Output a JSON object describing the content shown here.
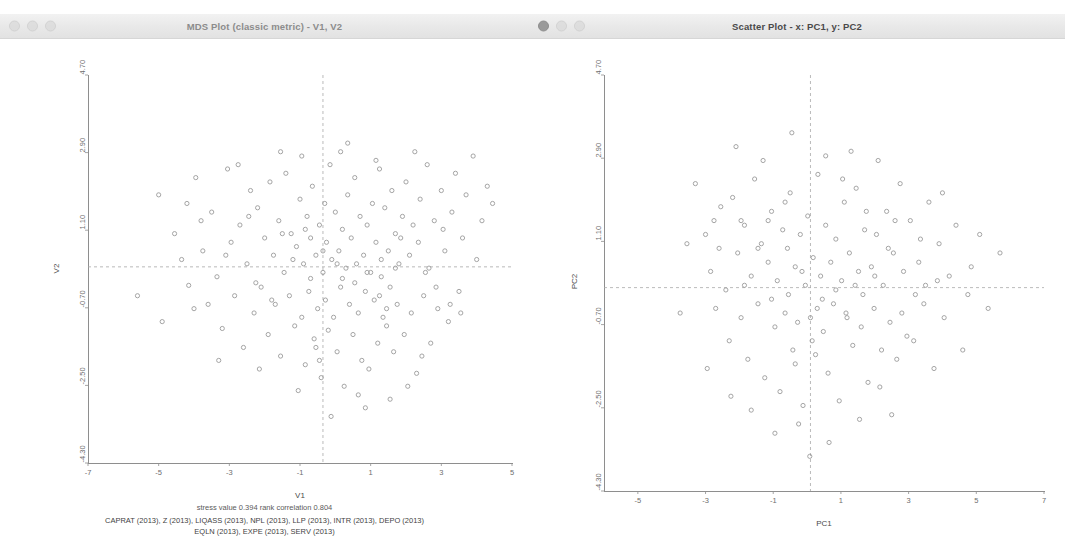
{
  "windows": {
    "mds": {
      "title": "MDS Plot (classic metric) - V1, V2",
      "traffic_lights": [
        "close",
        "minimize",
        "zoom"
      ],
      "axis": {
        "xlabel": "V1",
        "ylabel": "V2",
        "xticks": [
          "-7",
          "-5",
          "-3",
          "-1",
          "1",
          "3",
          "5"
        ],
        "yticks": [
          "4.70",
          "2.90",
          "1.10",
          "-0.70",
          "-2.50",
          "-4.30"
        ],
        "xlim": [
          -7,
          5
        ],
        "ylim": [
          -4.3,
          4.7
        ]
      },
      "stress_line": "stress value  0.394   rank correlation  0.804",
      "variables_line1": "CAPRAT (2013), Z (2013), LIQASS (2013), NPL (2013), LLP (2013), INTR (2013), DEPO (2013)",
      "variables_line2": "EQLN (2013), EXPE (2013), SERV (2013)"
    },
    "scatter": {
      "title": "Scatter Plot - x: PC1, y: PC2",
      "traffic_lights": [
        "close",
        "minimize",
        "zoom"
      ],
      "axis": {
        "xlabel": "PC1",
        "ylabel": "PC2",
        "xticks": [
          "-5",
          "-3",
          "-1",
          "1",
          "3",
          "5",
          "7"
        ],
        "yticks": [
          "4.70",
          "2.90",
          "1.10",
          "-0.70",
          "-2.50",
          "-4.30"
        ],
        "xlim": [
          -6,
          7
        ],
        "ylim": [
          -4.3,
          4.7
        ]
      }
    }
  },
  "style": {
    "point_color": "#9b9b9b",
    "reference_line_color": "#a8a8a8",
    "axis_color": "#8e8e8e"
  },
  "chart_data": [
    {
      "id": "mds",
      "type": "scatter",
      "title": "MDS Plot (classic metric) - V1, V2",
      "xlabel": "V1",
      "ylabel": "V2",
      "xlim": [
        -7,
        5
      ],
      "ylim": [
        -4.3,
        4.7
      ],
      "grid": false,
      "legend": "none",
      "annotations": [
        "stress value  0.394   rank correlation  0.804",
        "CAPRAT (2013), Z (2013), LIQASS (2013), NPL (2013), LLP (2013), INTR (2013), DEPO (2013)",
        "EQLN (2013), EXPE (2013), SERV (2013)"
      ],
      "reference_lines": {
        "vlines": [
          -0.35
        ],
        "hlines": [
          0.25
        ]
      },
      "marker": "open-circle",
      "points": [
        [
          -5.0,
          1.92
        ],
        [
          -4.55,
          1.02
        ],
        [
          -4.35,
          0.42
        ],
        [
          -4.15,
          -0.18
        ],
        [
          -3.95,
          2.32
        ],
        [
          -3.75,
          0.62
        ],
        [
          -3.6,
          -0.62
        ],
        [
          -3.5,
          1.52
        ],
        [
          -3.35,
          0.02
        ],
        [
          -3.2,
          -1.18
        ],
        [
          -3.05,
          2.52
        ],
        [
          -2.95,
          0.82
        ],
        [
          -2.85,
          -0.42
        ],
        [
          -2.7,
          1.22
        ],
        [
          -2.6,
          -1.62
        ],
        [
          -2.5,
          0.32
        ],
        [
          -2.4,
          2.02
        ],
        [
          -2.3,
          -0.82
        ],
        [
          -2.2,
          1.62
        ],
        [
          -2.1,
          -0.22
        ],
        [
          -2.0,
          0.92
        ],
        [
          -1.9,
          -1.32
        ],
        [
          -1.85,
          2.22
        ],
        [
          -1.75,
          0.52
        ],
        [
          -1.7,
          -0.62
        ],
        [
          -1.6,
          1.32
        ],
        [
          -1.55,
          -1.82
        ],
        [
          -1.45,
          0.12
        ],
        [
          -1.4,
          2.42
        ],
        [
          -1.3,
          -0.42
        ],
        [
          -1.25,
          1.02
        ],
        [
          -1.15,
          -1.12
        ],
        [
          -1.1,
          0.72
        ],
        [
          -1.0,
          1.82
        ],
        [
          -0.95,
          -0.92
        ],
        [
          -0.9,
          0.32
        ],
        [
          -0.85,
          -2.02
        ],
        [
          -0.8,
          1.42
        ],
        [
          -0.75,
          -0.32
        ],
        [
          -0.7,
          0.92
        ],
        [
          -0.65,
          2.12
        ],
        [
          -0.6,
          -1.42
        ],
        [
          -0.55,
          0.52
        ],
        [
          -0.5,
          -0.72
        ],
        [
          -0.45,
          1.22
        ],
        [
          -0.4,
          -2.32
        ],
        [
          -0.35,
          0.12
        ],
        [
          -0.3,
          1.72
        ],
        [
          -0.28,
          -0.52
        ],
        [
          -0.25,
          0.82
        ],
        [
          -0.2,
          -1.22
        ],
        [
          -0.15,
          2.62
        ],
        [
          -0.1,
          0.42
        ],
        [
          -0.05,
          -0.92
        ],
        [
          0.0,
          1.52
        ],
        [
          0.05,
          -1.72
        ],
        [
          0.1,
          0.62
        ],
        [
          0.15,
          -0.22
        ],
        [
          0.2,
          1.12
        ],
        [
          0.25,
          -2.52
        ],
        [
          0.3,
          0.22
        ],
        [
          0.35,
          1.92
        ],
        [
          0.4,
          -0.62
        ],
        [
          0.45,
          0.92
        ],
        [
          0.5,
          -1.32
        ],
        [
          0.55,
          2.32
        ],
        [
          0.6,
          0.32
        ],
        [
          0.65,
          -0.82
        ],
        [
          0.7,
          1.42
        ],
        [
          0.75,
          -1.92
        ],
        [
          0.8,
          0.52
        ],
        [
          0.85,
          -0.32
        ],
        [
          0.9,
          1.22
        ],
        [
          0.95,
          -2.12
        ],
        [
          1.0,
          0.12
        ],
        [
          1.05,
          1.72
        ],
        [
          1.1,
          -0.52
        ],
        [
          1.15,
          0.82
        ],
        [
          1.2,
          -1.52
        ],
        [
          1.25,
          2.52
        ],
        [
          1.3,
          0.42
        ],
        [
          1.35,
          -0.92
        ],
        [
          1.4,
          1.62
        ],
        [
          1.45,
          -1.12
        ],
        [
          1.5,
          0.62
        ],
        [
          1.55,
          -0.22
        ],
        [
          1.6,
          2.02
        ],
        [
          1.65,
          -1.72
        ],
        [
          1.7,
          1.02
        ],
        [
          1.75,
          -0.62
        ],
        [
          1.8,
          0.32
        ],
        [
          1.9,
          1.42
        ],
        [
          1.95,
          -1.32
        ],
        [
          2.0,
          2.22
        ],
        [
          2.1,
          0.52
        ],
        [
          2.15,
          -0.82
        ],
        [
          2.2,
          1.22
        ],
        [
          2.3,
          -2.22
        ],
        [
          2.35,
          0.82
        ],
        [
          2.4,
          1.82
        ],
        [
          2.5,
          -0.42
        ],
        [
          2.6,
          2.62
        ],
        [
          2.65,
          0.22
        ],
        [
          2.7,
          -1.52
        ],
        [
          2.8,
          1.32
        ],
        [
          2.9,
          -0.72
        ],
        [
          3.0,
          2.02
        ],
        [
          3.1,
          0.62
        ],
        [
          3.2,
          -1.02
        ],
        [
          3.3,
          1.52
        ],
        [
          3.4,
          2.42
        ],
        [
          3.5,
          -0.32
        ],
        [
          3.6,
          0.92
        ],
        [
          3.7,
          1.92
        ],
        [
          3.9,
          2.82
        ],
        [
          4.0,
          0.42
        ],
        [
          4.15,
          1.32
        ],
        [
          4.3,
          2.12
        ],
        [
          -5.6,
          -0.42
        ],
        [
          -4.9,
          -1.02
        ],
        [
          -4.2,
          1.72
        ],
        [
          -3.3,
          -1.92
        ],
        [
          -2.75,
          2.62
        ],
        [
          -2.15,
          -2.12
        ],
        [
          -1.5,
          1.02
        ],
        [
          -0.95,
          2.82
        ],
        [
          -0.55,
          -1.62
        ],
        [
          0.15,
          2.92
        ],
        [
          0.65,
          -2.72
        ],
        [
          1.25,
          -0.42
        ],
        [
          1.85,
          0.92
        ],
        [
          2.45,
          -1.82
        ],
        [
          3.05,
          1.12
        ],
        [
          3.55,
          -0.82
        ],
        [
          4.45,
          1.72
        ],
        [
          -0.12,
          -3.22
        ],
        [
          0.85,
          -3.02
        ],
        [
          1.55,
          -2.82
        ],
        [
          -1.05,
          -2.62
        ],
        [
          2.05,
          -2.52
        ],
        [
          0.35,
          3.12
        ],
        [
          -1.55,
          2.92
        ],
        [
          1.15,
          2.72
        ],
        [
          2.25,
          2.92
        ],
        [
          -2.45,
          1.42
        ],
        [
          -3.8,
          1.32
        ],
        [
          -0.7,
          -0.02
        ],
        [
          0.2,
          -0.02
        ],
        [
          1.3,
          0.02
        ],
        [
          -1.2,
          0.42
        ],
        [
          0.9,
          0.12
        ],
        [
          -0.35,
          0.62
        ],
        [
          0.55,
          -0.12
        ],
        [
          1.7,
          0.22
        ],
        [
          -1.8,
          -0.52
        ],
        [
          2.55,
          0.12
        ],
        [
          -2.25,
          -0.12
        ],
        [
          0.05,
          0.32
        ],
        [
          -0.85,
          1.12
        ],
        [
          1.45,
          -0.72
        ],
        [
          -0.45,
          -1.92
        ],
        [
          2.85,
          -0.22
        ],
        [
          -3.1,
          0.52
        ],
        [
          3.25,
          -0.62
        ],
        [
          -4.0,
          -0.72
        ]
      ]
    },
    {
      "id": "scatter",
      "type": "scatter",
      "title": "Scatter Plot - x: PC1, y: PC2",
      "xlabel": "PC1",
      "ylabel": "PC2",
      "xlim": [
        -6,
        7
      ],
      "ylim": [
        -4.3,
        4.7
      ],
      "grid": false,
      "legend": "none",
      "reference_lines": {
        "vlines": [
          0.1
        ],
        "hlines": [
          0.1
        ]
      },
      "marker": "open-circle",
      "points": [
        [
          -3.3,
          2.35
        ],
        [
          -3.0,
          1.25
        ],
        [
          -2.85,
          0.45
        ],
        [
          -2.7,
          -0.35
        ],
        [
          -2.55,
          1.85
        ],
        [
          -2.4,
          0.05
        ],
        [
          -2.3,
          -1.05
        ],
        [
          -2.2,
          2.05
        ],
        [
          -2.05,
          0.85
        ],
        [
          -1.95,
          -0.55
        ],
        [
          -1.85,
          1.45
        ],
        [
          -1.75,
          -1.45
        ],
        [
          -1.65,
          0.35
        ],
        [
          -1.55,
          2.45
        ],
        [
          -1.45,
          -0.25
        ],
        [
          -1.35,
          1.05
        ],
        [
          -1.25,
          -1.85
        ],
        [
          -1.15,
          0.65
        ],
        [
          -1.05,
          1.75
        ],
        [
          -0.95,
          -0.75
        ],
        [
          -0.88,
          0.25
        ],
        [
          -0.8,
          -2.15
        ],
        [
          -0.72,
          1.35
        ],
        [
          -0.65,
          -0.45
        ],
        [
          -0.58,
          0.95
        ],
        [
          -0.5,
          2.15
        ],
        [
          -0.42,
          -1.25
        ],
        [
          -0.35,
          0.55
        ],
        [
          -0.28,
          -0.65
        ],
        [
          -0.2,
          1.25
        ],
        [
          -0.12,
          -2.45
        ],
        [
          -0.05,
          0.15
        ],
        [
          0.02,
          1.65
        ],
        [
          0.1,
          -0.55
        ],
        [
          0.18,
          0.75
        ],
        [
          0.25,
          -1.35
        ],
        [
          0.32,
          2.55
        ],
        [
          0.4,
          0.35
        ],
        [
          0.48,
          -0.85
        ],
        [
          0.55,
          1.45
        ],
        [
          0.62,
          -1.75
        ],
        [
          0.7,
          0.65
        ],
        [
          0.78,
          -0.25
        ],
        [
          0.85,
          1.15
        ],
        [
          0.95,
          -2.35
        ],
        [
          1.02,
          0.25
        ],
        [
          1.1,
          1.95
        ],
        [
          1.18,
          -0.55
        ],
        [
          1.25,
          0.85
        ],
        [
          1.35,
          -1.15
        ],
        [
          1.45,
          2.25
        ],
        [
          1.52,
          0.45
        ],
        [
          1.6,
          -0.75
        ],
        [
          1.7,
          1.35
        ],
        [
          1.8,
          -1.95
        ],
        [
          1.9,
          0.55
        ],
        [
          1.98,
          -0.35
        ],
        [
          2.05,
          1.25
        ],
        [
          2.15,
          -2.05
        ],
        [
          2.25,
          0.15
        ],
        [
          2.35,
          1.75
        ],
        [
          2.45,
          -0.65
        ],
        [
          2.55,
          0.85
        ],
        [
          2.65,
          -1.45
        ],
        [
          2.75,
          2.35
        ],
        [
          2.85,
          0.45
        ],
        [
          2.95,
          -0.95
        ],
        [
          3.05,
          1.55
        ],
        [
          3.15,
          -1.05
        ],
        [
          3.3,
          0.65
        ],
        [
          3.45,
          -0.25
        ],
        [
          3.6,
          1.95
        ],
        [
          3.75,
          -1.65
        ],
        [
          3.9,
          1.05
        ],
        [
          4.05,
          -0.55
        ],
        [
          4.2,
          0.35
        ],
        [
          4.4,
          1.45
        ],
        [
          4.6,
          -1.25
        ],
        [
          4.85,
          0.55
        ],
        [
          5.1,
          1.25
        ],
        [
          5.35,
          -0.35
        ],
        [
          5.7,
          0.85
        ],
        [
          -2.1,
          3.15
        ],
        [
          -1.3,
          2.85
        ],
        [
          -0.45,
          3.45
        ],
        [
          0.55,
          2.95
        ],
        [
          1.3,
          3.05
        ],
        [
          2.1,
          2.85
        ],
        [
          -0.95,
          -3.05
        ],
        [
          -0.25,
          -2.85
        ],
        [
          0.65,
          -3.25
        ],
        [
          1.55,
          -2.75
        ],
        [
          -1.65,
          -2.55
        ],
        [
          2.5,
          -2.65
        ],
        [
          -3.55,
          1.05
        ],
        [
          -3.75,
          -0.45
        ],
        [
          -2.95,
          -1.65
        ],
        [
          -2.25,
          -2.25
        ],
        [
          -1.45,
          0.95
        ],
        [
          -0.65,
          1.95
        ],
        [
          0.15,
          -1.05
        ],
        [
          0.85,
          0.05
        ],
        [
          1.65,
          -0.05
        ],
        [
          2.4,
          0.95
        ],
        [
          3.2,
          -0.05
        ],
        [
          4.0,
          2.15
        ],
        [
          4.75,
          -0.05
        ],
        [
          -1.85,
          0.15
        ],
        [
          -1.05,
          -0.15
        ],
        [
          -0.35,
          -1.55
        ],
        [
          0.45,
          -0.15
        ],
        [
          1.15,
          -0.45
        ],
        [
          2.0,
          0.35
        ],
        [
          2.8,
          -0.45
        ],
        [
          3.5,
          0.15
        ],
        [
          -2.6,
          0.95
        ],
        [
          -0.15,
          0.45
        ],
        [
          0.3,
          -0.35
        ],
        [
          1.42,
          0.15
        ],
        [
          2.2,
          -1.25
        ],
        [
          3.35,
          1.15
        ],
        [
          -0.55,
          -0.05
        ],
        [
          0.08,
          -3.55
        ],
        [
          1.05,
          2.45
        ],
        [
          -1.95,
          1.55
        ],
        [
          3.85,
          0.25
        ],
        [
          -2.75,
          1.55
        ],
        [
          1.75,
          1.75
        ],
        [
          -1.15,
          1.55
        ],
        [
          2.6,
          1.55
        ]
      ]
    }
  ]
}
